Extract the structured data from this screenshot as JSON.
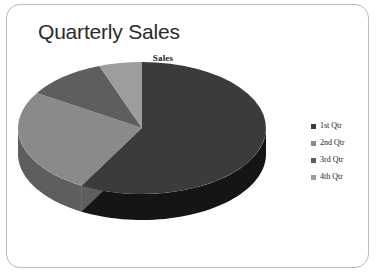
{
  "slide": {
    "title": "Quarterly Sales",
    "background_color": "#ffffff",
    "frame_color": "#b9bcc0"
  },
  "chart_data": {
    "type": "pie",
    "title": "Sales",
    "three_d": true,
    "categories": [
      "1st Qtr",
      "2nd Qtr",
      "3rd Qtr",
      "4th Qtr"
    ],
    "values": [
      58.1,
      25.8,
      10.5,
      5.6
    ],
    "colors": [
      "#3b3b3b",
      "#8a8a8a",
      "#5e5e5e",
      "#9d9d9d"
    ],
    "side_colors": [
      "#151515",
      "#5e5e5e",
      "#3b3b3b",
      "#6b6b6b"
    ],
    "start_angle": 0,
    "legend_position": "right",
    "data_labels": false,
    "grid": false,
    "xlabel": "",
    "ylabel": ""
  },
  "legend": {
    "items": [
      {
        "label": "1st Qtr",
        "color": "#3b3b3b"
      },
      {
        "label": "2nd Qtr",
        "color": "#8a8a8a"
      },
      {
        "label": "3rd Qtr",
        "color": "#5e5e5e"
      },
      {
        "label": "4th Qtr",
        "color": "#9d9d9d"
      }
    ]
  }
}
